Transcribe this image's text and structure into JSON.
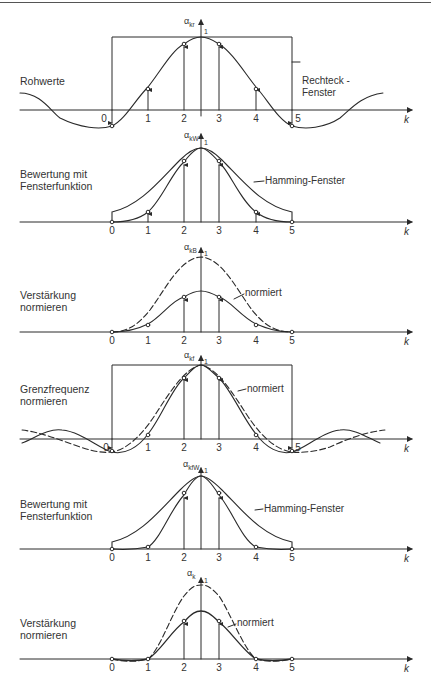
{
  "figure": {
    "panels": [
      {
        "id": "p1",
        "label": "Rohwerte",
        "y_axis_symbol": "α",
        "y_axis_subscript": "kr",
        "peak_label": "1",
        "annotations": [
          "Rechteck -\nFenster"
        ],
        "x_axis_label": "k",
        "x_ticks": [
          "0",
          "1",
          "2",
          "3",
          "4",
          "5"
        ]
      },
      {
        "id": "p2",
        "label": "Bewertung mit\nFensterfunktion",
        "y_axis_symbol": "α",
        "y_axis_subscript": "kW",
        "peak_label": "1",
        "annotations": [
          "Hamming-Fenster"
        ],
        "x_axis_label": "k",
        "x_ticks": [
          "0",
          "1",
          "2",
          "3",
          "4",
          "5"
        ]
      },
      {
        "id": "p3",
        "label": "Verstärkung\nnormieren",
        "y_axis_symbol": "α",
        "y_axis_subscript": "kB",
        "peak_label": "1",
        "annotations": [
          "normiert"
        ],
        "x_axis_label": "k",
        "x_ticks": [
          "0",
          "1",
          "2",
          "3",
          "4",
          "5"
        ]
      },
      {
        "id": "p4",
        "label": "Grenzfrequenz\nnormieren",
        "y_axis_symbol": "α",
        "y_axis_subscript": "kf",
        "peak_label": "1",
        "annotations": [
          "normiert"
        ],
        "x_axis_label": "k",
        "x_ticks": [
          "0",
          "1",
          "2",
          "3",
          "4",
          "5"
        ]
      },
      {
        "id": "p5",
        "label": "Bewertung mit\nFensterfunktion",
        "y_axis_symbol": "α",
        "y_axis_subscript": "kfW",
        "peak_label": "1",
        "annotations": [
          "Hamming-Fenster"
        ],
        "x_axis_label": "k",
        "x_ticks": [
          "0",
          "1",
          "2",
          "3",
          "4",
          "5"
        ]
      },
      {
        "id": "p6",
        "label": "Verstärkung\nnormieren",
        "y_axis_symbol": "α",
        "y_axis_subscript": "k",
        "peak_label": "1",
        "annotations": [
          "normiert"
        ],
        "x_axis_label": "k",
        "x_ticks": [
          "0",
          "1",
          "2",
          "3",
          "4",
          "5"
        ]
      }
    ]
  },
  "colors": {
    "ink": "#2a2a2a",
    "background": "#ffffff"
  }
}
